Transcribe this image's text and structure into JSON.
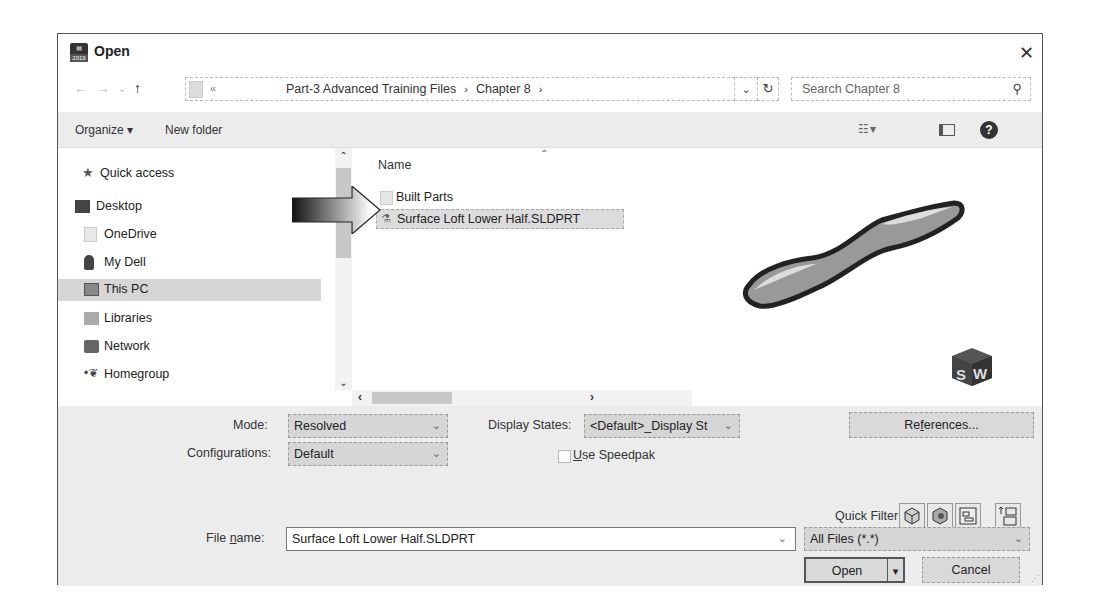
{
  "window": {
    "title": "Open",
    "app_icon_label": "SW 2019",
    "close_glyph": "✕"
  },
  "navigation": {
    "back_glyph": "←",
    "forward_glyph": "→",
    "recent_glyph": "⌄",
    "up_glyph": "↑",
    "address": {
      "overflow_glyph": "«",
      "breadcrumbs": [
        "Part-3 Advanced Training Files",
        "Chapter 8"
      ],
      "separator": "›",
      "dropdown_glyph": "⌄",
      "refresh_glyph": "↻"
    },
    "search": {
      "placeholder": "Search Chapter 8",
      "icon": "search-icon"
    }
  },
  "toolbar": {
    "organize_label": "Organize ▾",
    "new_folder_label": "New folder",
    "view_label": "☷ ▾",
    "help_label": "?"
  },
  "nav_pane": {
    "items": [
      {
        "label": "Quick access",
        "icon": "star-icon",
        "selected": false
      },
      {
        "label": "Desktop",
        "icon": "desktop-icon",
        "selected": false
      },
      {
        "label": "OneDrive",
        "icon": "folder-icon",
        "selected": false
      },
      {
        "label": "My Dell",
        "icon": "user-icon",
        "selected": false
      },
      {
        "label": "This PC",
        "icon": "computer-icon",
        "selected": true
      },
      {
        "label": "Libraries",
        "icon": "libraries-icon",
        "selected": false
      },
      {
        "label": "Network",
        "icon": "network-icon",
        "selected": false
      },
      {
        "label": "Homegroup",
        "icon": "homegroup-icon",
        "selected": false
      }
    ],
    "scroll_up": "⌃",
    "scroll_down": "⌄"
  },
  "file_list": {
    "column_name": "Name",
    "sort_glyph": "⌃",
    "rows": [
      {
        "name": "Built Parts",
        "type": "folder",
        "selected": false
      },
      {
        "name": "Surface Loft Lower Half.SLDPRT",
        "type": "sldprt",
        "selected": true
      }
    ],
    "hscroll_left": "‹",
    "hscroll_right": "›"
  },
  "preview": {
    "badge": "SW"
  },
  "options": {
    "mode_label": "Mode:",
    "mode_value": "Resolved",
    "configurations_label": "Configurations:",
    "configurations_value": "Default",
    "display_states_label": "Display States:",
    "display_states_value": "<Default>_Display St",
    "use_speedpak_pre": "",
    "use_speedpak_u": "U",
    "use_speedpak_post": "se Speedpak",
    "use_speedpak_checked": false,
    "references_pre": "Re",
    "references_u": "f",
    "references_post": "erences...",
    "quick_filter_label": "Quick Filter:",
    "quick_filter_icons": [
      "filter-parts-icon",
      "filter-assemblies-icon",
      "filter-drawings-icon",
      "filter-top-level-assemblies-icon"
    ]
  },
  "footer": {
    "file_name_pre": "File ",
    "file_name_u": "n",
    "file_name_post": "ame:",
    "file_name_value": "Surface Loft Lower Half.SLDPRT",
    "file_type_value": "All Files (*.*)",
    "open_label": "Open",
    "open_split_glyph": "▾",
    "cancel_label": "Cancel",
    "dropdown_glyph": "⌄"
  },
  "colors": {
    "selection": "#d6d6d6",
    "panel_bg": "#ececec",
    "button_bg": "#d9d9d9"
  }
}
